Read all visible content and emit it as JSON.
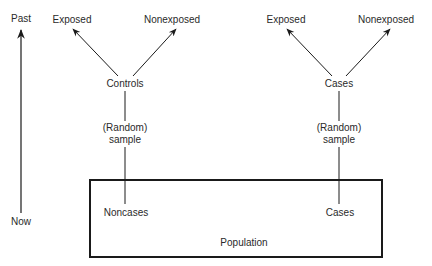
{
  "diagram": {
    "type": "case-control study design",
    "timeline": {
      "top_label": "Past",
      "bottom_label": "Now",
      "direction": "up"
    },
    "controls_branch": {
      "exposed_label": "Exposed",
      "nonexposed_label": "Nonexposed",
      "group_label": "Controls",
      "sample_line1": "(Random)",
      "sample_line2": "sample",
      "source_label": "Noncases"
    },
    "cases_branch": {
      "exposed_label": "Exposed",
      "nonexposed_label": "Nonexposed",
      "group_label": "Cases",
      "sample_line1": "(Random)",
      "sample_line2": "sample",
      "source_label": "Cases"
    },
    "population_label": "Population"
  },
  "colors": {
    "stroke": "#1a1a1a",
    "text": "#2a2a2a",
    "background": "#ffffff"
  }
}
